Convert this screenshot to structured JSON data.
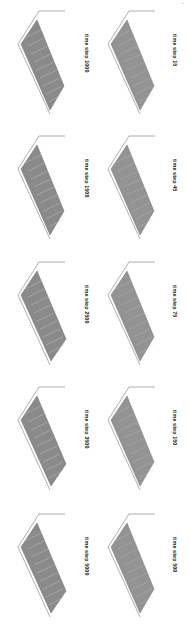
{
  "figure": {
    "layout": {
      "columns": 2,
      "rows": 5,
      "orientation": "rotated-90"
    },
    "caption_prefix": "time step",
    "panels_right": [
      {
        "label": "time step 15",
        "step": 15
      },
      {
        "label": "time step 45",
        "step": 45
      },
      {
        "label": "time step 75",
        "step": 75
      },
      {
        "label": "time step 150",
        "step": 150
      },
      {
        "label": "time step 500",
        "step": 500
      }
    ],
    "panels_left": [
      {
        "label": "time step 1000",
        "step": 1000
      },
      {
        "label": "time step 1500",
        "step": 1500
      },
      {
        "label": "time step 2500",
        "step": 2500
      },
      {
        "label": "time step 3500",
        "step": 3500
      },
      {
        "label": "time step 5000",
        "step": 5000
      }
    ],
    "colors": {
      "surface": "#8a8a8a",
      "surface_light": "#bdbdbd",
      "axis": "#9a9a9a",
      "text": "#222222"
    }
  }
}
